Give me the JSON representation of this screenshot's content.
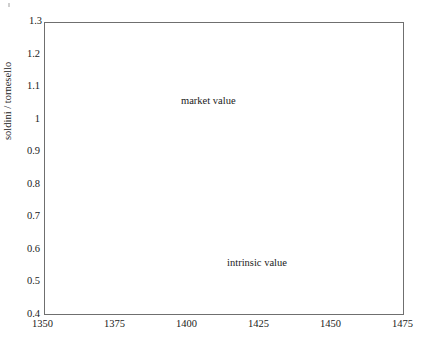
{
  "chart_data": {
    "type": "scatter",
    "title": "",
    "xlabel": "",
    "ylabel": "soldini / tornesello",
    "xlim": [
      1350,
      1475
    ],
    "ylim": [
      0.4,
      1.3
    ],
    "xticks": [
      1350,
      1375,
      1400,
      1425,
      1450,
      1475
    ],
    "xtick_labels": [
      "1350",
      "1375",
      "1400",
      "1425",
      "1450",
      "1475"
    ],
    "yticks": [
      0.4,
      0.5,
      0.6,
      0.7,
      0.8,
      0.9,
      1.0,
      1.1,
      1.2,
      1.3
    ],
    "ytick_labels": [
      "0.4",
      "0.5",
      "0.6",
      "0.7",
      "0.8",
      "0.9",
      "1",
      "1.1",
      "1.2",
      "1.3"
    ],
    "grid": false,
    "legend_position": "inline-annotation",
    "series": [
      {
        "name": "market value",
        "type": "scatter",
        "marker": "asterisk",
        "color": "#1a1a1a",
        "label_text": "market value",
        "label_x": 1408,
        "label_y": 1.055,
        "points": [
          [
            1352.0,
            1.0
          ],
          [
            1357.5,
            1.08
          ],
          [
            1361.0,
            0.988
          ],
          [
            1374.0,
            1.002
          ],
          [
            1379.0,
            1.02
          ],
          [
            1385.5,
            1.06
          ],
          [
            1393.0,
            1.002
          ],
          [
            1399.0,
            0.948
          ],
          [
            1405.0,
            0.932
          ],
          [
            1404.0,
            0.918
          ],
          [
            1405.5,
            0.918
          ],
          [
            1409.5,
            0.962
          ],
          [
            1411.0,
            0.9
          ],
          [
            1411.0,
            0.884
          ],
          [
            1411.0,
            0.868
          ],
          [
            1410.0,
            0.852
          ],
          [
            1411.5,
            0.852
          ],
          [
            1412.5,
            0.852
          ],
          [
            1411.0,
            0.832
          ],
          [
            1415.5,
            0.852
          ],
          [
            1412.0,
            0.792
          ],
          [
            1419.0,
            0.8
          ],
          [
            1424.0,
            0.782
          ],
          [
            1420.0,
            0.742
          ],
          [
            1425.0,
            0.742
          ],
          [
            1429.5,
            0.752
          ],
          [
            1433.0,
            0.718
          ],
          [
            1438.0,
            0.718
          ],
          [
            1442.0,
            0.718
          ],
          [
            1443.5,
            0.752
          ],
          [
            1444.5,
            0.756
          ],
          [
            1445.0,
            0.748
          ],
          [
            1444.0,
            0.718
          ],
          [
            1450.0,
            0.652
          ],
          [
            1451.0,
            0.748
          ],
          [
            1456.0,
            0.7
          ],
          [
            1458.5,
            0.815
          ],
          [
            1462.5,
            0.762
          ],
          [
            1463.5,
            0.93
          ],
          [
            1465.0,
            1.01
          ]
        ]
      },
      {
        "name": "intrinsic value",
        "type": "step",
        "color": "#6f6f6f",
        "label_text": "intrinsic value",
        "label_x": 1424,
        "label_y": 0.558,
        "steps": [
          [
            1350,
            0.48
          ],
          [
            1369,
            0.48
          ],
          [
            1369,
            0.52
          ],
          [
            1382,
            0.52
          ],
          [
            1382,
            0.548
          ],
          [
            1390,
            0.548
          ],
          [
            1390,
            0.578
          ],
          [
            1399,
            0.578
          ],
          [
            1399,
            0.608
          ],
          [
            1412,
            0.608
          ],
          [
            1412,
            0.638
          ],
          [
            1417,
            0.638
          ],
          [
            1417,
            0.662
          ],
          [
            1427,
            0.662
          ],
          [
            1427,
            0.69
          ],
          [
            1435,
            0.69
          ],
          [
            1435,
            0.712
          ],
          [
            1444,
            0.712
          ],
          [
            1444,
            0.755
          ],
          [
            1462,
            0.755
          ],
          [
            1462,
            1.14
          ],
          [
            1468,
            1.14
          ],
          [
            1468,
            1.2
          ],
          [
            1475,
            1.2
          ]
        ]
      }
    ]
  },
  "figure": {
    "axis_color": "#6f6f6f",
    "marker_color": "#1a1a1a",
    "background": "#ffffff"
  }
}
